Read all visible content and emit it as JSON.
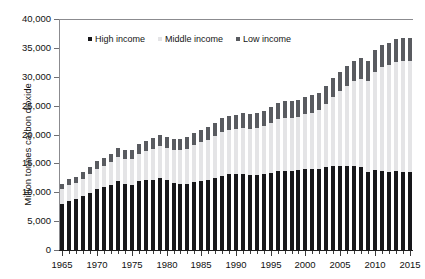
{
  "title_fragment": "",
  "chart_data": {
    "type": "bar",
    "subtype": "stacked-column",
    "title": "",
    "xlabel": "",
    "ylabel": "Million tonnes carbon dioxide",
    "ylim": [
      0,
      40000
    ],
    "ytick_step": 5000,
    "ytick_labels": [
      "40,000",
      "35,000",
      "30,000",
      "25,000",
      "20,000",
      "15,000",
      "10,000",
      "5,000",
      "0"
    ],
    "ytick_values": [
      40000,
      35000,
      30000,
      25000,
      20000,
      15000,
      10000,
      5000,
      0
    ],
    "grid": false,
    "legend_position": "top-left-inside",
    "xlim": [
      1965,
      2015
    ],
    "x": [
      1965,
      1966,
      1967,
      1968,
      1969,
      1970,
      1971,
      1972,
      1973,
      1974,
      1975,
      1976,
      1977,
      1978,
      1979,
      1980,
      1981,
      1982,
      1983,
      1984,
      1985,
      1986,
      1987,
      1988,
      1989,
      1990,
      1991,
      1992,
      1993,
      1994,
      1995,
      1996,
      1997,
      1998,
      1999,
      2000,
      2001,
      2002,
      2003,
      2004,
      2005,
      2006,
      2007,
      2008,
      2009,
      2010,
      2011,
      2012,
      2013,
      2014,
      2015
    ],
    "xtick_labels": [
      "1965",
      "1970",
      "1975",
      "1980",
      "1985",
      "1990",
      "1995",
      "2000",
      "2005",
      "2010",
      "2015"
    ],
    "xtick_values": [
      1965,
      1970,
      1975,
      1980,
      1985,
      1990,
      1995,
      2000,
      2005,
      2010,
      2015
    ],
    "series": [
      {
        "name": "High income",
        "color": "#17171a",
        "values": [
          8000,
          8500,
          8800,
          9300,
          9900,
          10600,
          10900,
          11300,
          11900,
          11500,
          11300,
          11900,
          12100,
          12200,
          12500,
          12100,
          11600,
          11400,
          11400,
          11800,
          12000,
          12200,
          12500,
          12900,
          13100,
          13100,
          13100,
          13000,
          13000,
          13100,
          13300,
          13600,
          13700,
          13700,
          13800,
          14100,
          14100,
          14100,
          14300,
          14500,
          14600,
          14600,
          14600,
          14400,
          13500,
          13900,
          13700,
          13500,
          13600,
          13500,
          13500
        ]
      },
      {
        "name": "Middle income",
        "color": "#e4e4e6",
        "values": [
          2500,
          2700,
          2800,
          3000,
          3200,
          3500,
          3700,
          3900,
          4200,
          4300,
          4500,
          4800,
          5000,
          5300,
          5500,
          5600,
          5700,
          5900,
          6100,
          6400,
          6700,
          6900,
          7200,
          7500,
          7700,
          7800,
          8000,
          8000,
          8200,
          8400,
          8700,
          9000,
          9200,
          9200,
          9300,
          9500,
          9700,
          10100,
          11000,
          12000,
          12900,
          13800,
          14600,
          15200,
          15700,
          16900,
          18000,
          18500,
          19000,
          19200,
          19300
        ]
      },
      {
        "name": "Low income",
        "color": "#595b60",
        "values": [
          1000,
          1050,
          1100,
          1150,
          1250,
          1350,
          1400,
          1450,
          1550,
          1550,
          1600,
          1700,
          1750,
          1850,
          1900,
          1900,
          1900,
          1950,
          2000,
          2050,
          2150,
          2200,
          2300,
          2400,
          2450,
          2500,
          2550,
          2550,
          2600,
          2650,
          2700,
          2800,
          2850,
          2850,
          2900,
          2950,
          3000,
          3050,
          3150,
          3250,
          3350,
          3450,
          3550,
          3600,
          3600,
          3750,
          3850,
          3900,
          3950,
          3980,
          3990
        ]
      }
    ],
    "totals": [
      11500,
      12250,
      12700,
      13450,
      14350,
      15450,
      16000,
      16650,
      17650,
      17350,
      17400,
      18400,
      18850,
      19350,
      19900,
      19600,
      19200,
      19250,
      19500,
      20250,
      20850,
      21300,
      22000,
      22800,
      23250,
      23400,
      23650,
      23550,
      23800,
      24150,
      24700,
      25400,
      25750,
      25750,
      26000,
      26550,
      26800,
      27250,
      28450,
      29750,
      30850,
      31850,
      32750,
      33200,
      32800,
      34550,
      35550,
      35900,
      36550,
      36680,
      36790
    ]
  },
  "legend": {
    "items": [
      {
        "label": "High income",
        "color": "#17171a"
      },
      {
        "label": "Middle income",
        "color": "#e4e4e6"
      },
      {
        "label": "Low income",
        "color": "#595b60"
      }
    ]
  }
}
